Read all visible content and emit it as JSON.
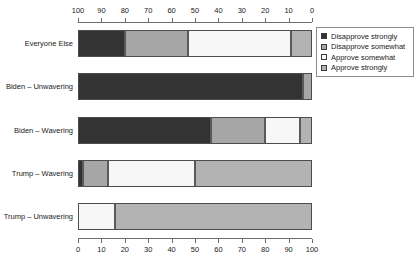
{
  "chart_data": {
    "type": "bar",
    "orientation": "horizontal",
    "stacked": true,
    "stack_mode": "percent",
    "title": "",
    "subtitle": "",
    "xlabel": "",
    "ylabel": "",
    "xlim": [
      0,
      100
    ],
    "grid": false,
    "legend_position": "top-right",
    "top_axis": {
      "reversed": true,
      "ticks": [
        100,
        90,
        80,
        70,
        60,
        50,
        40,
        30,
        20,
        10,
        0
      ],
      "tick_labels": [
        "100",
        "90",
        "80",
        "70",
        "60",
        "50",
        "40",
        "30",
        "20",
        "10",
        "0"
      ]
    },
    "bottom_axis": {
      "reversed": false,
      "ticks": [
        0,
        10,
        20,
        30,
        40,
        50,
        60,
        70,
        80,
        90,
        100
      ],
      "tick_labels": [
        "0",
        "10",
        "20",
        "30",
        "40",
        "50",
        "60",
        "70",
        "80",
        "90",
        "100"
      ]
    },
    "categories": [
      "Everyone Else",
      "Biden – Unwavering",
      "Biden – Wavering",
      "Trump – Wavering",
      "Trump – Unwavering"
    ],
    "series": [
      {
        "name": "Disapprove strongly",
        "color": "#333333",
        "values": [
          20,
          96,
          57,
          2,
          0
        ]
      },
      {
        "name": "Disapprove somewhat",
        "color": "#a6a6a6",
        "values": [
          27,
          4,
          23,
          11,
          0
        ]
      },
      {
        "name": "Approve somewhat",
        "color": "#f7f7f7",
        "values": [
          44,
          0,
          15,
          37,
          16
        ]
      },
      {
        "name": "Approve strongly",
        "color": "#b3b3b3",
        "values": [
          9,
          0,
          5,
          50,
          84
        ]
      }
    ],
    "legend_entries": [
      "Disapprove strongly",
      "Disapprove somewhat",
      "Approve somewhat",
      "Approve strongly"
    ],
    "legend_colors": [
      "#333333",
      "#a6a6a6",
      "#f7f7f7",
      "#b3b3b3"
    ]
  }
}
